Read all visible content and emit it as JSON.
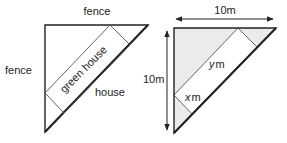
{
  "left_diagram": {
    "labels": {
      "top_fence": "fence",
      "left_fence": "fence",
      "greenhouse": "green house",
      "house": "house"
    }
  },
  "right_diagram": {
    "labels": {
      "width": "10m",
      "height": "10m",
      "y_var": "y",
      "y_unit": "m",
      "x_var": "x",
      "x_unit": "m"
    },
    "shading_color": "#ebebeb"
  }
}
